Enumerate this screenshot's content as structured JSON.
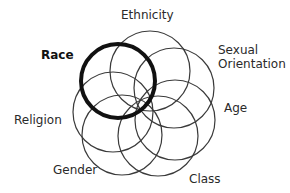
{
  "diagram": {
    "type": "overlapping-circles-rosette",
    "highlighted": "Race",
    "colors": {
      "background": "#ffffff",
      "circle_stroke": "#3a3a3a",
      "highlight_stroke": "#111111",
      "text": "#2a2a2a"
    },
    "circles": [
      {
        "id": "ethnicity",
        "label": "Ethnicity",
        "cx": 150,
        "cy": 71,
        "r": 40,
        "highlight": false
      },
      {
        "id": "sexual-orientation",
        "label": "Sexual Orientation",
        "cx": 174,
        "cy": 88,
        "r": 40,
        "highlight": false
      },
      {
        "id": "age",
        "label": "Age",
        "cx": 175,
        "cy": 120,
        "r": 40,
        "highlight": false
      },
      {
        "id": "class",
        "label": "Class",
        "cx": 158,
        "cy": 136,
        "r": 40,
        "highlight": false
      },
      {
        "id": "gender",
        "label": "Gender",
        "cx": 122,
        "cy": 135,
        "r": 40,
        "highlight": false
      },
      {
        "id": "religion",
        "label": "Religion",
        "cx": 113,
        "cy": 112,
        "r": 40,
        "highlight": false
      },
      {
        "id": "race",
        "label": "Race",
        "cx": 118,
        "cy": 81,
        "r": 37,
        "highlight": true
      }
    ],
    "labels": {
      "ethnicity": "Ethnicity",
      "race": "Race",
      "sexual_orientation_line1": "Sexual",
      "sexual_orientation_line2": "Orientation",
      "age": "Age",
      "religion": "Religion",
      "gender": "Gender",
      "class": "Class"
    }
  }
}
